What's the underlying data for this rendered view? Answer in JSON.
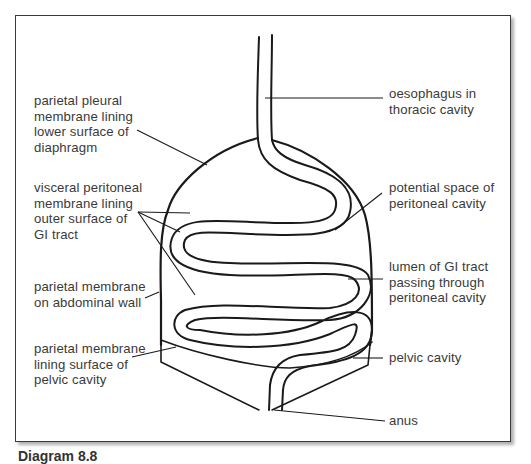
{
  "figure": {
    "caption": "Diagram 8.8",
    "type": "anatomical diagram"
  },
  "labels": {
    "left": [
      {
        "id": "parietal-pleural",
        "text": "parietal pleural\nmembrane lining\nlower surface of\ndiaphragm"
      },
      {
        "id": "visceral-peritoneal",
        "text": "visceral peritoneal\nmembrane lining\nouter surface of\nGI tract"
      },
      {
        "id": "parietal-abdominal",
        "text": "parietal membrane\non abdominal wall"
      },
      {
        "id": "parietal-pelvic",
        "text": "parietal membrane\nlining surface of\npelvic cavity"
      }
    ],
    "right": [
      {
        "id": "oesophagus",
        "text": "oesophagus in\nthoracic cavity"
      },
      {
        "id": "potential-space",
        "text": "potential space of\nperitoneal cavity"
      },
      {
        "id": "lumen",
        "text": "lumen of GI tract\npassing through\nperitoneal cavity"
      },
      {
        "id": "pelvic-cavity",
        "text": "pelvic cavity"
      },
      {
        "id": "anus",
        "text": "anus"
      }
    ]
  },
  "colors": {
    "line": "#1a1a1a",
    "text": "#3a3a3a",
    "frame": "#3a3a3a",
    "background": "#ffffff"
  }
}
